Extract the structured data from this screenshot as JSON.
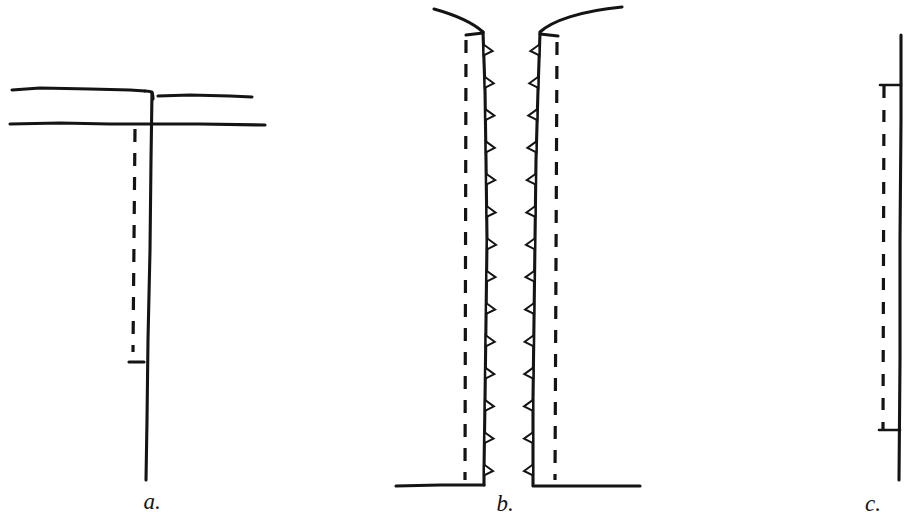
{
  "document": {
    "kind": "line-drawing-figure-plate",
    "background_color": "#ffffff",
    "ink_color": "#141414",
    "width": 904,
    "height": 520
  },
  "figures": [
    {
      "id": "a",
      "label": "a.",
      "label_x": 152,
      "label_y": 509,
      "description": "T-shaped junction: two long horizontal lines crossed by a long vertical line with a dashed line beside it",
      "parts": [
        {
          "name": "upper-horizontal-line-left",
          "type": "polyline",
          "points": "12,90 40,88 90,89 130,90 145,91"
        },
        {
          "name": "upper-horizontal-line-right",
          "type": "polyline",
          "points": "158,96 190,95 230,96 252,97"
        },
        {
          "name": "junction-corner-curve",
          "type": "path",
          "d": "M145,91 C152,91 153,92 153,99"
        },
        {
          "name": "lower-horizontal-line",
          "type": "polyline",
          "points": "10,124 60,123 110,124 150,124 200,124 265,125"
        },
        {
          "name": "vertical-solid-line",
          "type": "polyline",
          "points": "152,92 151,160 150,250 148,340 147,420 146,480"
        },
        {
          "name": "vertical-dashed-line",
          "type": "dashed",
          "x1": 135,
          "y1": 129,
          "x2": 133,
          "y2": 352
        },
        {
          "name": "dashed-end-tick",
          "type": "polyline",
          "points": "129,362 144,362"
        }
      ]
    },
    {
      "id": "b",
      "label": "b.",
      "label_x": 505,
      "label_y": 511,
      "description": "Narrow channel between two walls with serrated inner faces, flaring curves at top and a horizontal floor at bottom",
      "parts": [
        {
          "name": "left-flare-curve",
          "type": "path",
          "d": "M434,9 C452,14 472,22 483,32"
        },
        {
          "name": "right-flare-curve",
          "type": "path",
          "d": "M540,32 C552,21 580,11 622,7"
        },
        {
          "name": "left-wall-outer",
          "type": "polyline",
          "points": "483,32 485,90 486,160 487,240 486,320 485,400 484,470 484,485"
        },
        {
          "name": "right-wall-outer",
          "type": "polyline",
          "points": "540,33 538,90 536,160 535,240 534,320 533,400 533,470 533,485"
        },
        {
          "name": "left-wall-top-cap",
          "type": "polyline",
          "points": "466,35 483,33"
        },
        {
          "name": "right-wall-top-cap",
          "type": "polyline",
          "points": "540,34 558,36"
        },
        {
          "name": "floor-left-segment",
          "type": "polyline",
          "points": "396,486 440,485 470,485 484,485"
        },
        {
          "name": "floor-right-segment",
          "type": "polyline",
          "points": "533,486 570,486 610,486 640,486"
        },
        {
          "name": "left-dashed-line",
          "type": "dashed",
          "x1": 466,
          "y1": 40,
          "x2": 465,
          "y2": 480
        },
        {
          "name": "right-dashed-line",
          "type": "dashed",
          "x1": 557,
          "y1": 42,
          "x2": 555,
          "y2": 480
        },
        {
          "name": "left-wall-teeth",
          "type": "teeth",
          "side": "right",
          "count": 14,
          "y_start": 50,
          "y_end": 470
        },
        {
          "name": "right-wall-teeth",
          "type": "teeth",
          "side": "left",
          "count": 14,
          "y_start": 50,
          "y_end": 470
        }
      ]
    },
    {
      "id": "c",
      "label": "c.",
      "label_x": 873,
      "label_y": 511,
      "description": "Single solid vertical line at right with a shorter dashed line beside it, bracketed by two short horizontal tick marks",
      "parts": [
        {
          "name": "vertical-solid-line",
          "type": "polyline",
          "points": "901,35 901,120 900,240 900,360 899,480"
        },
        {
          "name": "vertical-dashed-line",
          "type": "dashed",
          "x1": 884,
          "y1": 86,
          "x2": 883,
          "y2": 430
        },
        {
          "name": "top-tick",
          "type": "polyline",
          "points": "880,85 901,85"
        },
        {
          "name": "bottom-tick",
          "type": "polyline",
          "points": "879,430 900,430"
        }
      ]
    }
  ]
}
